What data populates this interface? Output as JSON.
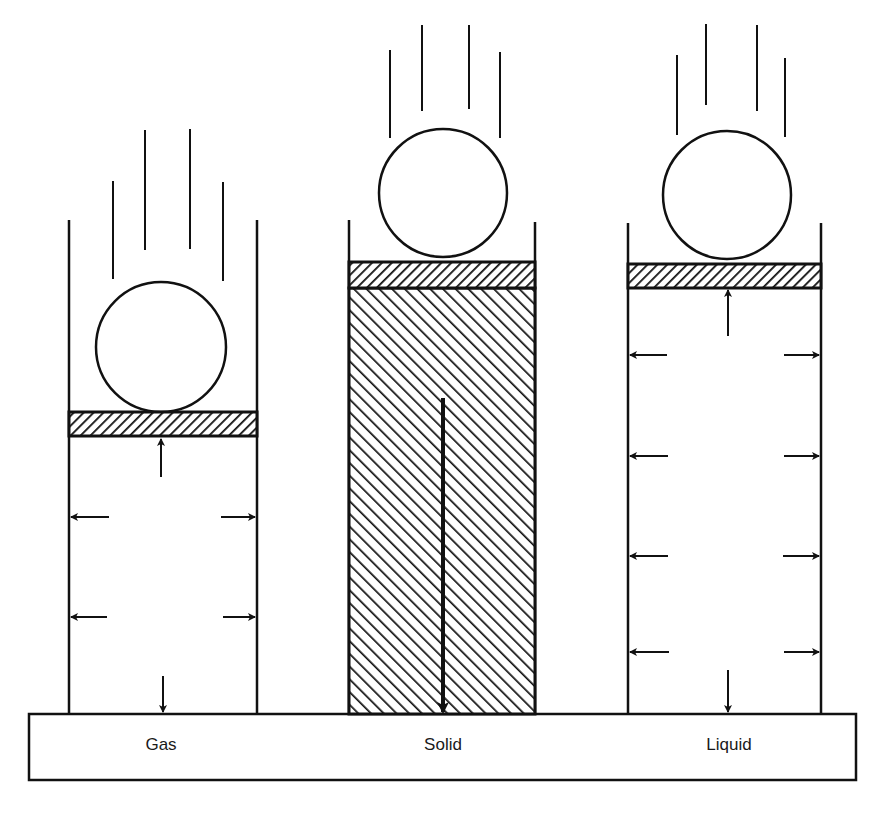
{
  "figure": {
    "colors": {
      "ink": "#111111",
      "background": "#ffffff"
    },
    "containers": [
      {
        "id": "gas",
        "label": "Gas",
        "piston_hatch": "forward-diagonal",
        "fill": "none",
        "pressure_arrows": [
          "up-to-piston",
          "left-wall",
          "right-wall",
          "left-wall",
          "right-wall",
          "down-to-base"
        ]
      },
      {
        "id": "solid",
        "label": "Solid",
        "piston_hatch": "forward-diagonal",
        "fill": "back-diagonal hatch",
        "pressure_arrows": [
          "down-to-base"
        ]
      },
      {
        "id": "liquid",
        "label": "Liquid",
        "piston_hatch": "forward-diagonal",
        "fill": "none",
        "pressure_arrows": [
          "up-to-piston",
          "left-wall x4",
          "right-wall x4",
          "down-to-base"
        ]
      }
    ]
  }
}
